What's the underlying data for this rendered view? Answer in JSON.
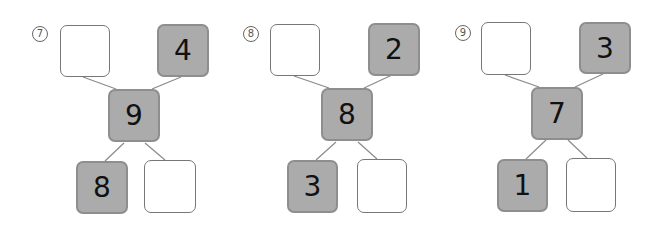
{
  "puzzles": [
    {
      "label": "7",
      "top_left": "",
      "top_right": "4",
      "middle": "9",
      "bottom_left": "8",
      "bottom_right": ""
    },
    {
      "label": "8",
      "top_left": "",
      "top_right": "2",
      "middle": "8",
      "bottom_left": "3",
      "bottom_right": ""
    },
    {
      "label": "9",
      "top_left": "",
      "top_right": "3",
      "middle": "7",
      "bottom_left": "1",
      "bottom_right": ""
    }
  ],
  "colors": {
    "filled": "#ababab",
    "filled_border": "#8e8e8e",
    "line": "#8a8a8a"
  }
}
